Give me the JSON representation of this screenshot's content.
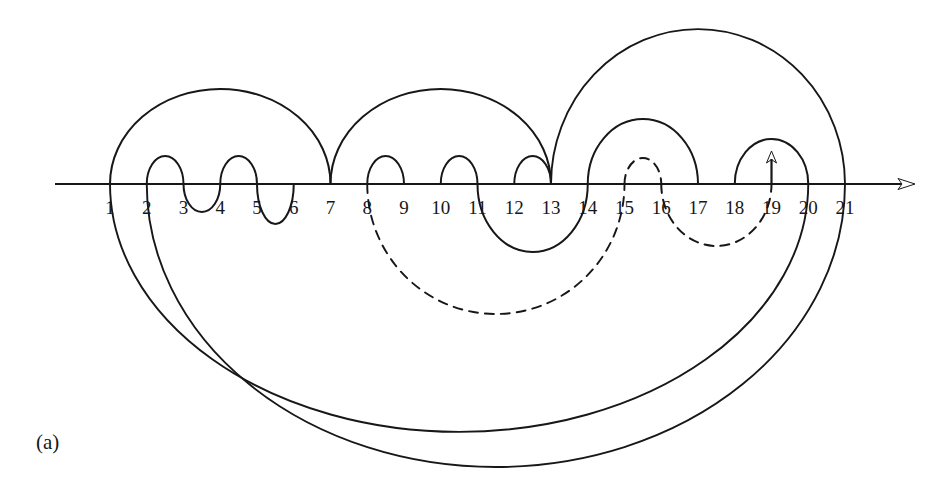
{
  "figure": {
    "caption": "(a)",
    "title": "",
    "background_color": "#ffffff",
    "stroke_color": "#17171a",
    "width": 948,
    "height": 498
  },
  "axis": {
    "name": "number-line",
    "y": 184,
    "x_start": 55,
    "x_end": 915,
    "arrow_direction": "right",
    "has_arrowhead": true
  },
  "tick_labels": [
    "1",
    "2",
    "3",
    "4",
    "5",
    "6",
    "7",
    "8",
    "9",
    "10",
    "11",
    "12",
    "13",
    "14",
    "15",
    "16",
    "17",
    "18",
    "19",
    "20",
    "21"
  ],
  "node_positions_px": [
    110,
    146.75,
    183.5,
    220.25,
    257,
    293.75,
    330.5,
    367.25,
    404,
    440.75,
    477.5,
    514.25,
    551,
    587.75,
    624.5,
    661.25,
    698,
    734.75,
    771.5,
    808.25,
    845
  ],
  "marker": {
    "type": "up-arrow",
    "at_position": 19,
    "x": 771.5,
    "y_base": 184,
    "y_tip": 151
  },
  "chart_data": {
    "type": "chord-diagram",
    "title": "(a)",
    "xlabel": "",
    "ylabel": "",
    "n_nodes": 21,
    "arcs": [
      {
        "id": "u-1-7",
        "from": 1,
        "to": 7,
        "side": "above",
        "style": "solid",
        "height": 95
      },
      {
        "id": "u-2-3",
        "from": 2,
        "to": 3,
        "side": "above",
        "style": "solid",
        "height": 28
      },
      {
        "id": "u-4-5",
        "from": 4,
        "to": 5,
        "side": "above",
        "style": "solid",
        "height": 28
      },
      {
        "id": "u-7-13",
        "from": 7,
        "to": 13,
        "side": "above",
        "style": "solid",
        "height": 95
      },
      {
        "id": "u-8-9",
        "from": 8,
        "to": 9,
        "side": "above",
        "style": "solid",
        "height": 28
      },
      {
        "id": "u-10-11",
        "from": 10,
        "to": 11,
        "side": "above",
        "style": "solid",
        "height": 28
      },
      {
        "id": "u-12-13",
        "from": 12,
        "to": 13,
        "side": "above",
        "style": "solid",
        "height": 28
      },
      {
        "id": "u-13-21",
        "from": 13,
        "to": 21,
        "side": "above",
        "style": "solid",
        "height": 155
      },
      {
        "id": "u-14-17",
        "from": 14,
        "to": 17,
        "side": "above",
        "style": "solid",
        "height": 65
      },
      {
        "id": "u-15-16",
        "from": 15,
        "to": 16,
        "side": "above",
        "style": "dashed",
        "height": 26
      },
      {
        "id": "u-18-20",
        "from": 18,
        "to": 20,
        "side": "above",
        "style": "solid",
        "height": 45
      },
      {
        "id": "l-1-20",
        "from": 1,
        "to": 20,
        "side": "below",
        "style": "solid",
        "height": 248
      },
      {
        "id": "l-2-21",
        "from": 2,
        "to": 21,
        "side": "below",
        "style": "solid",
        "height": 283
      },
      {
        "id": "l-3-4",
        "from": 3,
        "to": 4,
        "side": "below",
        "style": "solid",
        "height": 28
      },
      {
        "id": "l-5-6",
        "from": 5,
        "to": 6,
        "side": "below",
        "style": "solid",
        "height": 40
      },
      {
        "id": "l-8-15",
        "from": 8,
        "to": 15,
        "side": "below",
        "style": "dashed",
        "height": 130
      },
      {
        "id": "l-11-14",
        "from": 11,
        "to": 14,
        "side": "below",
        "style": "solid",
        "height": 68
      },
      {
        "id": "l-16-19",
        "from": 16,
        "to": 19,
        "side": "below",
        "style": "dashed",
        "height": 62
      }
    ],
    "legend": [],
    "grid": false
  }
}
